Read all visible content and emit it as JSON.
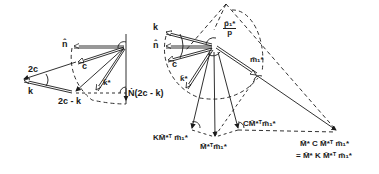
{
  "diagram": {
    "left": {
      "labels": {
        "n": "n̂",
        "c": "c",
        "two_c": "2c",
        "k": "k",
        "two_c_minus_k": "2c - k",
        "k_star": "k̃*",
        "N": "Ṅ(2c - k)"
      }
    },
    "right": {
      "labels": {
        "k": "k",
        "n": "n̂",
        "c": "c",
        "k_star": "k̃*",
        "p_ratio_num": "p̃₁*",
        "p_ratio_den": "p",
        "m1_star": "m̃₁*",
        "KM": "KM̃*ᵀ m̃₁*",
        "M": "M̃*ᵀm̃₁*",
        "CM": "CM̃*ᵀm̃₁*",
        "result_line1": "M̃* C M̃*ᵀ m̃₁*",
        "result_line2": "= M̃* K M̃*ᵀ m̃₁*"
      }
    },
    "colors": {
      "ink": "#1a1a1a",
      "background": "#ffffff"
    }
  }
}
